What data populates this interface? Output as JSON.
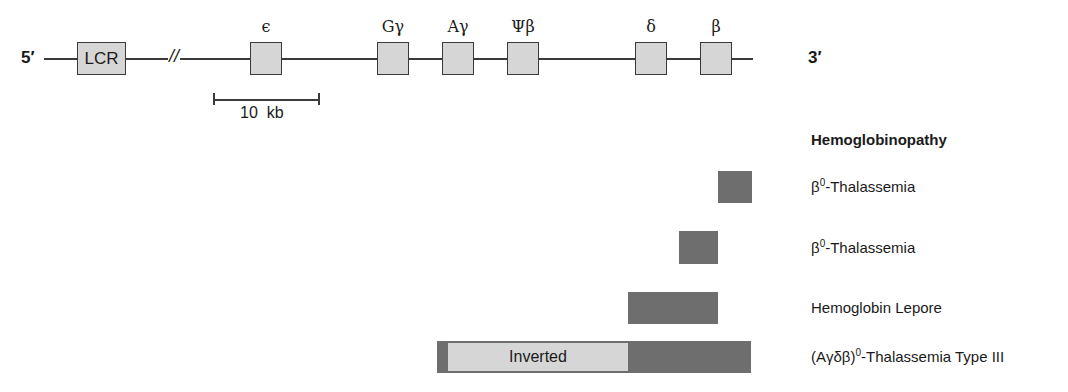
{
  "map": {
    "five_prime": "5′",
    "three_prime": "3′",
    "break_mark": "//",
    "genes": [
      {
        "id": "lcr",
        "label": "LCR",
        "inside": true
      },
      {
        "id": "epsilon",
        "label": "ϵ"
      },
      {
        "id": "g-gamma",
        "label": "Gγ"
      },
      {
        "id": "a-gamma",
        "label": "Aγ"
      },
      {
        "id": "psi-beta",
        "label": "Ψβ"
      },
      {
        "id": "delta",
        "label": "δ"
      },
      {
        "id": "beta",
        "label": "β"
      }
    ],
    "scale_bar": {
      "label": "10  kb"
    }
  },
  "deletions": {
    "heading": "Hemoglobinopathy",
    "rows": [
      {
        "prefix": "β",
        "sup": "0",
        "suffix": "-Thalassemia"
      },
      {
        "prefix": "β",
        "sup": "0",
        "suffix": "-Thalassemia"
      },
      {
        "prefix": "Hemoglobin Lepore",
        "sup": "",
        "suffix": ""
      },
      {
        "prefix": "(Aγδβ)",
        "sup": "0",
        "suffix": "-Thalassemia Type III"
      }
    ],
    "inverted_label": "Inverted"
  },
  "colors": {
    "gene_fill": "#d6d6d6",
    "deletion_fill": "#6e6e6e",
    "line": "#3a3a3a"
  }
}
